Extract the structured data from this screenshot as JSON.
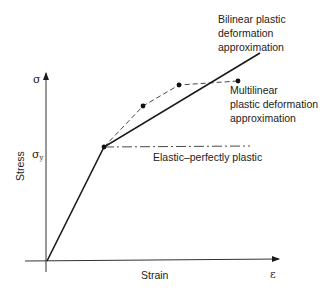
{
  "diagram": {
    "title": "",
    "axes": {
      "y_symbol": "σ",
      "y_label": "Stress",
      "x_symbol": "ε",
      "x_label": "Strain",
      "yield_symbol": "σ",
      "yield_subscript": "y"
    },
    "curves": [
      {
        "name": "Bilinear plastic deformation approximation",
        "style": "solid",
        "points": [
          [
            47,
            261
          ],
          [
            104,
            147
          ],
          [
            260,
            53
          ]
        ]
      },
      {
        "name": "Multilinear plastic deformation approximation",
        "style": "dashed",
        "points": [
          [
            104,
            147
          ],
          [
            143,
            106
          ],
          [
            179,
            85
          ],
          [
            238,
            81
          ]
        ]
      },
      {
        "name": "Elastic–perfectly plastic",
        "style": "dash-dot",
        "points": [
          [
            104,
            147
          ],
          [
            250,
            146
          ]
        ]
      }
    ],
    "labels": {
      "bilinear": [
        "Bilinear plastic",
        "deformation",
        "approximation"
      ],
      "multilinear": [
        "Multilinear",
        "plastic deformation",
        "approximation"
      ],
      "elastic_perfectly_plastic": "Elastic–perfectly plastic"
    },
    "colors": {
      "line": "#1a1a1a",
      "text": "#222222",
      "background": "#ffffff"
    }
  }
}
